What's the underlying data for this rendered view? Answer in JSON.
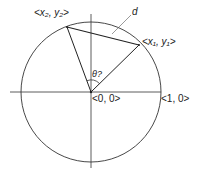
{
  "diagram": {
    "type": "unit-circle-chord",
    "stroke_color": "#222222",
    "background": "#ffffff",
    "labels": {
      "point2": "<x₂, y₂>",
      "point1": "<x₁, y₁>",
      "origin": "<0, 0>",
      "unit_x": "<1, 0>",
      "chord": "d",
      "angle": "θ?"
    },
    "geometry": {
      "center": [
        91,
        92
      ],
      "radius": 70,
      "point1": [
        139,
        45
      ],
      "point2": [
        67,
        27
      ]
    }
  }
}
